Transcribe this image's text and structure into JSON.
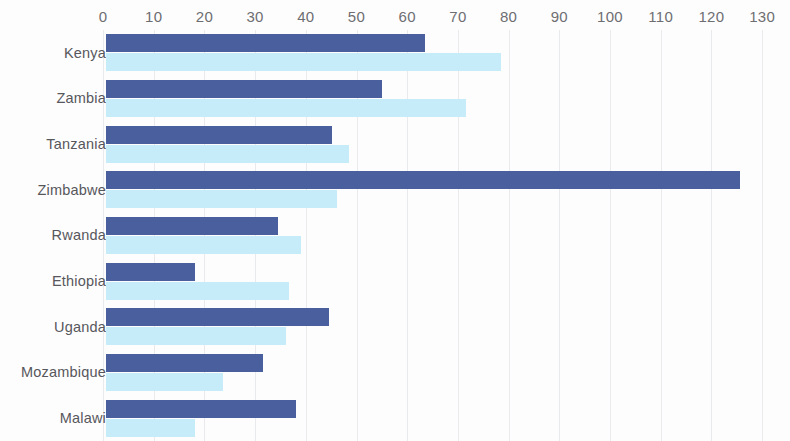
{
  "chart_data": {
    "type": "bar",
    "orientation": "horizontal",
    "title": "",
    "subtitle": "",
    "xlabel": "",
    "ylabel": "",
    "xlim": [
      0,
      130
    ],
    "x_ticks": [
      0,
      10,
      20,
      30,
      40,
      50,
      60,
      70,
      80,
      90,
      100,
      110,
      120,
      130
    ],
    "x_tick_labels": [
      "0",
      "10",
      "20",
      "30",
      "40",
      "50",
      "60",
      "70",
      "80",
      "90",
      "100",
      "110",
      "120",
      "130"
    ],
    "grid": true,
    "grid_axis": "x",
    "legend": false,
    "legend_position": "none",
    "categories": [
      "Kenya",
      "Zambia",
      "Tanzania",
      "Zimbabwe",
      "Rwanda",
      "Ethiopia",
      "Uganda",
      "Mozambique",
      "Malawi"
    ],
    "series": [
      {
        "name": "series-primary",
        "color": "#4a5f9e",
        "values": [
          63,
          54.5,
          44.5,
          125,
          34,
          17.5,
          44,
          31,
          37.5
        ]
      },
      {
        "name": "series-secondary",
        "color": "#c5ecf8",
        "values": [
          78,
          71,
          48,
          45.5,
          38.5,
          36,
          35.5,
          23,
          17.5
        ]
      }
    ]
  },
  "colors": {
    "primary": "#4a5f9e",
    "secondary": "#c5ecf8",
    "gridline": "#e9eaee",
    "tick_text": "#6e6e72",
    "category_text": "#57575c",
    "background": "#fdfdfd"
  }
}
